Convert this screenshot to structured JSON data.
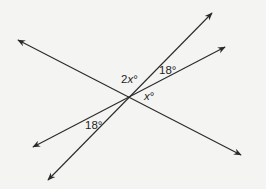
{
  "diagram": {
    "type": "intersecting-lines-angles",
    "colors": {
      "background": "#f4f4f2",
      "line": "#2a2a2a",
      "text": "#1e1e1e"
    },
    "intersection": {
      "x": 129,
      "y": 97
    },
    "lines": [
      {
        "name": "line-nw-se",
        "from": {
          "x": 18,
          "y": 40
        },
        "to": {
          "x": 241,
          "y": 155
        },
        "arrows": "both"
      },
      {
        "name": "line-steep",
        "from": {
          "x": 48,
          "y": 180
        },
        "to": {
          "x": 212,
          "y": 13
        },
        "arrows": "both"
      },
      {
        "name": "line-shallow",
        "from": {
          "x": 33,
          "y": 147
        },
        "to": {
          "x": 225,
          "y": 47
        },
        "arrows": "both"
      }
    ],
    "labels": {
      "top_angle": {
        "coef": "2",
        "var": "x",
        "deg": "°"
      },
      "upper_right_angle": "18°",
      "right_angle": {
        "var": "x",
        "deg": "°"
      },
      "lower_left_angle": "18°"
    }
  }
}
